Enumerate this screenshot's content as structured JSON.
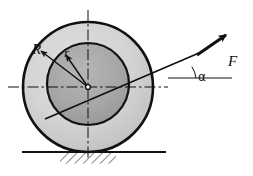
{
  "figure": {
    "background_color": "#ffffff"
  },
  "labels": {
    "outer_radius": "R",
    "inner_radius": "r",
    "force": "F",
    "angle": "α"
  },
  "colors": {
    "outline": "#111111",
    "outer_disc_fill": "#d2d2d2",
    "inner_disc_fill": "#a8a8a8",
    "ground_line": "#111111",
    "hatch": "#222222",
    "centerline": "#111111"
  },
  "geometry": {
    "center_x": 88,
    "center_y": 87,
    "outer_radius_px": 65,
    "inner_radius_px": 41,
    "inner_center_x": 88,
    "inner_center_y": 84,
    "ground_y": 152,
    "ground_x_start": 22,
    "ground_x_end": 166,
    "hatch_x_start": 60,
    "hatch_x_end": 116,
    "hatch_height": 11,
    "force_angle_deg": 22,
    "force_arrow_tail_x": 196,
    "force_arrow_tail_y": 55,
    "force_arrow_tip_x": 228,
    "force_arrow_tip_y": 33,
    "angle_vertex_x": 223,
    "angle_reference_y": 78,
    "angle_arc_radius": 26
  },
  "elements": {
    "outer_circle_name": "outer-wheel-circle",
    "inner_circle_name": "inner-axle-circle",
    "horizontal_centerline_name": "horizontal-centerline",
    "vertical_centerline_name": "vertical-centerline",
    "center_hub_name": "center-point",
    "radius_R_leader_name": "radius-R-leader-line",
    "radius_r_leader_name": "radius-r-leader-line",
    "force_line_name": "force-action-line",
    "force_arrow_name": "force-arrow",
    "angle_reference_line_name": "angle-reference-horizontal",
    "angle_arc_name": "angle-arc",
    "ground_line_name": "ground-line",
    "hatching_name": "ground-hatching"
  }
}
